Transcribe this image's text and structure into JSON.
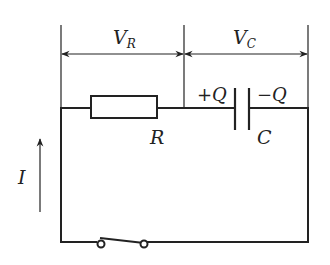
{
  "diagram": {
    "colors": {
      "line": "#222222",
      "background": "#ffffff"
    },
    "labels": {
      "voltage_resistor_main": "V",
      "voltage_resistor_sub": "R",
      "voltage_capacitor_main": "V",
      "voltage_capacitor_sub": "C",
      "resistor": "R",
      "capacitor": "C",
      "charge_positive": "+Q",
      "charge_negative": "−Q",
      "current": "I"
    },
    "components": [
      {
        "type": "resistor",
        "label": "R"
      },
      {
        "type": "capacitor",
        "label": "C",
        "plates": [
          "+Q",
          "−Q"
        ]
      },
      {
        "type": "switch",
        "state": "open"
      }
    ],
    "annotations": [
      {
        "type": "dimension-arrow",
        "label": "V_R",
        "span": "resistor"
      },
      {
        "type": "dimension-arrow",
        "label": "V_C",
        "span": "capacitor"
      },
      {
        "type": "current-arrow",
        "label": "I",
        "direction": "up"
      }
    ]
  }
}
